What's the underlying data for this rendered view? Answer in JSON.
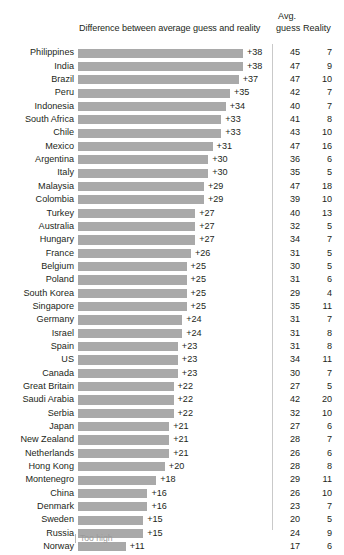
{
  "header": {
    "bar_column_title": "Difference between average guess and reality",
    "avg_line1": "Avg.",
    "avg_line2": "guess",
    "reality": "Reality"
  },
  "legend": {
    "too_high": "Too high"
  },
  "style": {
    "bar_color": "#a9a9a9",
    "text_color": "#231f20",
    "divider_color": "#c9c9c9",
    "legend_color": "#9b9b9b"
  },
  "chart_data": {
    "type": "bar",
    "title": "Difference between average guess and reality",
    "xlabel": "",
    "ylabel": "",
    "orientation": "horizontal",
    "grid": false,
    "legend_position": "bottom-left",
    "xlim": [
      0,
      38
    ],
    "columns": [
      "Country",
      "Difference",
      "Avg. guess",
      "Reality"
    ],
    "categories": [
      "Philippines",
      "India",
      "Brazil",
      "Peru",
      "Indonesia",
      "South Africa",
      "Chile",
      "Mexico",
      "Argentina",
      "Italy",
      "Malaysia",
      "Colombia",
      "Turkey",
      "Australia",
      "Hungary",
      "France",
      "Belgium",
      "Poland",
      "South Korea",
      "Singapore",
      "Germany",
      "Israel",
      "Spain",
      "US",
      "Canada",
      "Great Britain",
      "Saudi Arabia",
      "Serbia",
      "Japan",
      "New Zealand",
      "Netherlands",
      "Hong Kong",
      "Montenegro",
      "China",
      "Denmark",
      "Sweden",
      "Russia",
      "Norway"
    ],
    "values": [
      38,
      38,
      37,
      35,
      34,
      33,
      33,
      31,
      30,
      30,
      29,
      29,
      27,
      27,
      27,
      26,
      25,
      25,
      25,
      25,
      24,
      24,
      23,
      23,
      23,
      22,
      22,
      22,
      21,
      21,
      21,
      20,
      18,
      16,
      16,
      15,
      15,
      11
    ],
    "value_labels": [
      "+38",
      "+38",
      "+37",
      "+35",
      "+34",
      "+33",
      "+33",
      "+31",
      "+30",
      "+30",
      "+29",
      "+29",
      "+27",
      "+27",
      "+27",
      "+26",
      "+25",
      "+25",
      "+25",
      "+25",
      "+24",
      "+24",
      "+23",
      "+23",
      "+23",
      "+22",
      "+22",
      "+22",
      "+21",
      "+21",
      "+21",
      "+20",
      "+18",
      "+16",
      "+16",
      "+15",
      "+15",
      "+11"
    ],
    "series": [
      {
        "name": "Avg. guess",
        "values": [
          45,
          47,
          47,
          42,
          40,
          41,
          43,
          47,
          36,
          35,
          47,
          39,
          40,
          32,
          34,
          31,
          30,
          31,
          29,
          35,
          31,
          31,
          31,
          34,
          30,
          27,
          42,
          32,
          27,
          28,
          26,
          28,
          29,
          26,
          23,
          20,
          24,
          17
        ]
      },
      {
        "name": "Reality",
        "values": [
          7,
          9,
          10,
          7,
          7,
          8,
          10,
          16,
          6,
          5,
          18,
          10,
          13,
          5,
          7,
          5,
          5,
          6,
          4,
          11,
          7,
          8,
          8,
          11,
          7,
          5,
          20,
          10,
          6,
          7,
          6,
          8,
          11,
          10,
          7,
          5,
          9,
          6
        ]
      }
    ],
    "rows": [
      {
        "country": "Philippines",
        "diff": 38,
        "diff_label": "+38",
        "guess": "45",
        "reality": "7"
      },
      {
        "country": "India",
        "diff": 38,
        "diff_label": "+38",
        "guess": "47",
        "reality": "9"
      },
      {
        "country": "Brazil",
        "diff": 37,
        "diff_label": "+37",
        "guess": "47",
        "reality": "10"
      },
      {
        "country": "Peru",
        "diff": 35,
        "diff_label": "+35",
        "guess": "42",
        "reality": "7"
      },
      {
        "country": "Indonesia",
        "diff": 34,
        "diff_label": "+34",
        "guess": "40",
        "reality": "7"
      },
      {
        "country": "South Africa",
        "diff": 33,
        "diff_label": "+33",
        "guess": "41",
        "reality": "8"
      },
      {
        "country": "Chile",
        "diff": 33,
        "diff_label": "+33",
        "guess": "43",
        "reality": "10"
      },
      {
        "country": "Mexico",
        "diff": 31,
        "diff_label": "+31",
        "guess": "47",
        "reality": "16"
      },
      {
        "country": "Argentina",
        "diff": 30,
        "diff_label": "+30",
        "guess": "36",
        "reality": "6"
      },
      {
        "country": "Italy",
        "diff": 30,
        "diff_label": "+30",
        "guess": "35",
        "reality": "5"
      },
      {
        "country": "Malaysia",
        "diff": 29,
        "diff_label": "+29",
        "guess": "47",
        "reality": "18"
      },
      {
        "country": "Colombia",
        "diff": 29,
        "diff_label": "+29",
        "guess": "39",
        "reality": "10"
      },
      {
        "country": "Turkey",
        "diff": 27,
        "diff_label": "+27",
        "guess": "40",
        "reality": "13"
      },
      {
        "country": "Australia",
        "diff": 27,
        "diff_label": "+27",
        "guess": "32",
        "reality": "5"
      },
      {
        "country": "Hungary",
        "diff": 27,
        "diff_label": "+27",
        "guess": "34",
        "reality": "7"
      },
      {
        "country": "France",
        "diff": 26,
        "diff_label": "+26",
        "guess": "31",
        "reality": "5"
      },
      {
        "country": "Belgium",
        "diff": 25,
        "diff_label": "+25",
        "guess": "30",
        "reality": "5"
      },
      {
        "country": "Poland",
        "diff": 25,
        "diff_label": "+25",
        "guess": "31",
        "reality": "6"
      },
      {
        "country": "South Korea",
        "diff": 25,
        "diff_label": "+25",
        "guess": "29",
        "reality": "4"
      },
      {
        "country": "Singapore",
        "diff": 25,
        "diff_label": "+25",
        "guess": "35",
        "reality": "11"
      },
      {
        "country": "Germany",
        "diff": 24,
        "diff_label": "+24",
        "guess": "31",
        "reality": "7"
      },
      {
        "country": "Israel",
        "diff": 24,
        "diff_label": "+24",
        "guess": "31",
        "reality": "8"
      },
      {
        "country": "Spain",
        "diff": 23,
        "diff_label": "+23",
        "guess": "31",
        "reality": "8"
      },
      {
        "country": "US",
        "diff": 23,
        "diff_label": "+23",
        "guess": "34",
        "reality": "11"
      },
      {
        "country": "Canada",
        "diff": 23,
        "diff_label": "+23",
        "guess": "30",
        "reality": "7"
      },
      {
        "country": "Great Britain",
        "diff": 22,
        "diff_label": "+22",
        "guess": "27",
        "reality": "5"
      },
      {
        "country": "Saudi Arabia",
        "diff": 22,
        "diff_label": "+22",
        "guess": "42",
        "reality": "20"
      },
      {
        "country": "Serbia",
        "diff": 22,
        "diff_label": "+22",
        "guess": "32",
        "reality": "10"
      },
      {
        "country": "Japan",
        "diff": 21,
        "diff_label": "+21",
        "guess": "27",
        "reality": "6"
      },
      {
        "country": "New Zealand",
        "diff": 21,
        "diff_label": "+21",
        "guess": "28",
        "reality": "7"
      },
      {
        "country": "Netherlands",
        "diff": 21,
        "diff_label": "+21",
        "guess": "26",
        "reality": "6"
      },
      {
        "country": "Hong Kong",
        "diff": 20,
        "diff_label": "+20",
        "guess": "28",
        "reality": "8"
      },
      {
        "country": "Montenegro",
        "diff": 18,
        "diff_label": "+18",
        "guess": "29",
        "reality": "11"
      },
      {
        "country": "China",
        "diff": 16,
        "diff_label": "+16",
        "guess": "26",
        "reality": "10"
      },
      {
        "country": "Denmark",
        "diff": 16,
        "diff_label": "+16",
        "guess": "23",
        "reality": "7"
      },
      {
        "country": "Sweden",
        "diff": 15,
        "diff_label": "+15",
        "guess": "20",
        "reality": "5"
      },
      {
        "country": "Russia",
        "diff": 15,
        "diff_label": "+15",
        "guess": "24",
        "reality": "9"
      },
      {
        "country": "Norway",
        "diff": 11,
        "diff_label": "+11",
        "guess": "17",
        "reality": "6"
      }
    ]
  }
}
